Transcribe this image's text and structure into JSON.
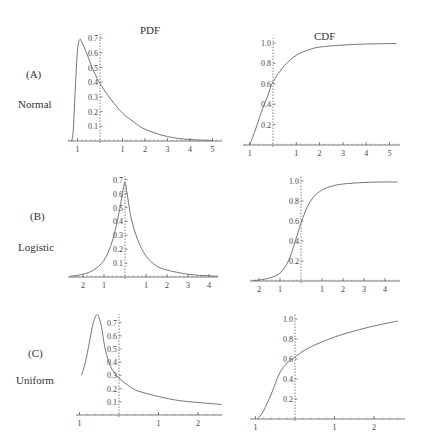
{
  "column_titles": [
    "PDF",
    "CDF"
  ],
  "rows": [
    {
      "letter": "(A)",
      "name": "Normal"
    },
    {
      "letter": "(B)",
      "name": "Logistic"
    },
    {
      "letter": "(C)",
      "name": "Uniform"
    }
  ],
  "chart_data": [
    {
      "type": "line",
      "title": "PDF",
      "row": "(A) Normal",
      "xlabel": "",
      "ylabel": "",
      "yticks": [
        0.1,
        0.2,
        0.3,
        0.4,
        0.5,
        0.6,
        0.7
      ],
      "xtick_labels": [
        "1",
        "1",
        "2",
        "3",
        "4",
        "5"
      ],
      "xticks": [
        -1,
        1,
        2,
        3,
        4,
        5
      ],
      "ylim": [
        0,
        0.72
      ],
      "xlim": [
        -1.4,
        5.2
      ],
      "series": [
        {
          "name": "pdf",
          "x": [
            -1.3,
            -1.2,
            -1.1,
            -1.0,
            -0.9,
            -0.8,
            -0.6,
            -0.4,
            -0.2,
            0,
            0.5,
            1,
            1.5,
            2,
            3,
            4,
            5
          ],
          "y": [
            0.0,
            0.05,
            0.35,
            0.62,
            0.69,
            0.67,
            0.6,
            0.52,
            0.45,
            0.39,
            0.28,
            0.19,
            0.13,
            0.08,
            0.03,
            0.01,
            0.004
          ]
        }
      ]
    },
    {
      "type": "line",
      "title": "CDF",
      "row": "(A) Normal",
      "yticks": [
        0.2,
        0.4,
        0.6,
        0.8,
        1.0
      ],
      "xtick_labels": [
        "1",
        "1",
        "2",
        "3",
        "4",
        "5"
      ],
      "xticks": [
        -1,
        1,
        2,
        3,
        4,
        5
      ],
      "ylim": [
        0,
        1.05
      ],
      "xlim": [
        -1.3,
        5.4
      ],
      "series": [
        {
          "name": "cdf",
          "x": [
            -1.0,
            -0.8,
            -0.5,
            -0.2,
            0,
            0.5,
            1,
            1.5,
            2,
            3,
            4,
            5.3
          ],
          "y": [
            0.0,
            0.12,
            0.32,
            0.5,
            0.62,
            0.78,
            0.88,
            0.93,
            0.96,
            0.98,
            0.99,
            0.995
          ]
        }
      ]
    },
    {
      "type": "line",
      "title": "PDF",
      "row": "(B) Logistic",
      "yticks": [
        0.1,
        0.2,
        0.3,
        0.4,
        0.5,
        0.6,
        0.7
      ],
      "xtick_labels": [
        "2",
        "1",
        "1",
        "2",
        "3",
        "4"
      ],
      "xticks": [
        -2,
        -1,
        1,
        2,
        3,
        4
      ],
      "ylim": [
        0,
        0.72
      ],
      "xlim": [
        -2.6,
        4.4
      ],
      "series": [
        {
          "name": "pdf",
          "x": [
            -2.6,
            -2,
            -1.5,
            -1,
            -0.6,
            -0.3,
            -0.1,
            0,
            0.1,
            0.3,
            0.6,
            1,
            1.5,
            2,
            3,
            4,
            4.4
          ],
          "y": [
            0.005,
            0.02,
            0.05,
            0.12,
            0.26,
            0.45,
            0.62,
            0.68,
            0.6,
            0.42,
            0.27,
            0.15,
            0.08,
            0.05,
            0.02,
            0.008,
            0.005
          ]
        }
      ]
    },
    {
      "type": "line",
      "title": "CDF",
      "row": "(B) Logistic",
      "yticks": [
        0.2,
        0.4,
        0.6,
        0.8,
        1.0
      ],
      "xtick_labels": [
        "2",
        "1",
        "1",
        "2",
        "3",
        "4"
      ],
      "xticks": [
        -2,
        -1,
        1,
        2,
        3,
        4
      ],
      "ylim": [
        0,
        1.05
      ],
      "xlim": [
        -2.4,
        4.6
      ],
      "series": [
        {
          "name": "cdf",
          "x": [
            -2.3,
            -2,
            -1.5,
            -1,
            -0.6,
            -0.3,
            0,
            0.3,
            0.6,
            1,
            1.5,
            2,
            3,
            4,
            4.6
          ],
          "y": [
            0.005,
            0.01,
            0.03,
            0.08,
            0.2,
            0.38,
            0.58,
            0.74,
            0.84,
            0.91,
            0.95,
            0.97,
            0.985,
            0.99,
            0.99
          ]
        }
      ]
    },
    {
      "type": "line",
      "title": "PDF",
      "row": "(C) Uniform",
      "yticks": [
        0.1,
        0.2,
        0.3,
        0.4,
        0.5,
        0.6,
        0.7
      ],
      "xtick_labels": [
        "1",
        "1",
        "2"
      ],
      "xticks": [
        -1,
        1,
        2
      ],
      "ylim": [
        0,
        0.75
      ],
      "xlim": [
        -1.05,
        2.65
      ],
      "series": [
        {
          "name": "pdf",
          "x": [
            -0.95,
            -0.85,
            -0.75,
            -0.65,
            -0.55,
            -0.45,
            -0.35,
            -0.2,
            0,
            0.25,
            0.5,
            1,
            1.5,
            2,
            2.6
          ],
          "y": [
            0.3,
            0.4,
            0.55,
            0.7,
            0.76,
            0.68,
            0.5,
            0.36,
            0.28,
            0.22,
            0.18,
            0.14,
            0.11,
            0.095,
            0.08
          ]
        }
      ]
    },
    {
      "type": "line",
      "title": "CDF",
      "row": "(C) Uniform",
      "yticks": [
        0.2,
        0.4,
        0.6,
        0.8,
        1.0
      ],
      "xtick_labels": [
        "1",
        "1",
        "2"
      ],
      "xticks": [
        -1,
        1,
        2
      ],
      "ylim": [
        0,
        1.05
      ],
      "xlim": [
        -1.1,
        2.65
      ],
      "series": [
        {
          "name": "cdf",
          "x": [
            -0.95,
            -0.8,
            -0.6,
            -0.4,
            -0.2,
            0,
            0.25,
            0.5,
            1,
            1.5,
            2,
            2.6
          ],
          "y": [
            0.0,
            0.08,
            0.25,
            0.45,
            0.56,
            0.62,
            0.69,
            0.74,
            0.82,
            0.88,
            0.93,
            0.98
          ]
        }
      ]
    }
  ]
}
